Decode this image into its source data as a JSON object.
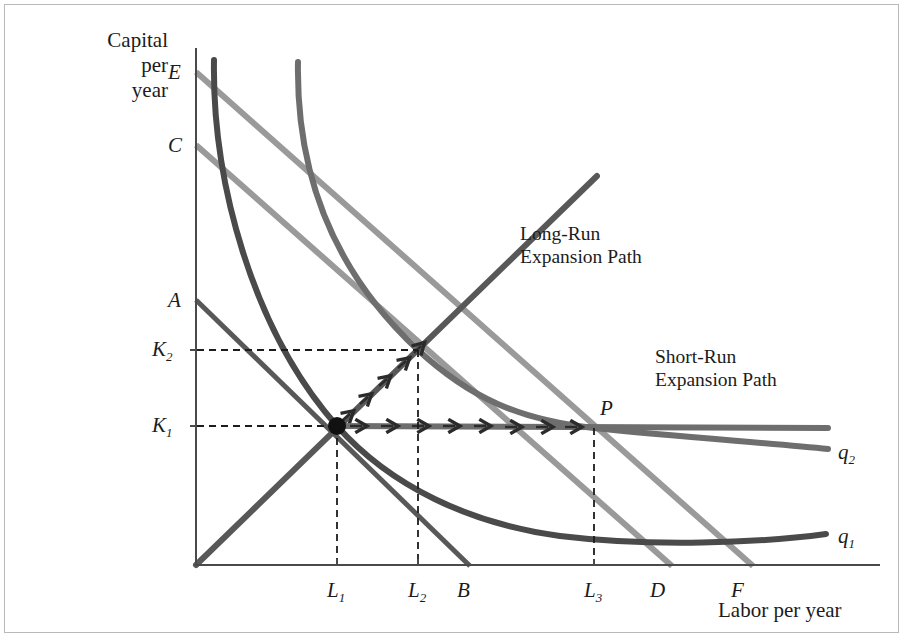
{
  "figure": {
    "type": "economics-isoquant-isocost-diagram",
    "background": "#ffffff",
    "border_color": "#b9b9b9"
  },
  "axes": {
    "y_title_line1": "Capital",
    "y_title_line2": "per",
    "y_title_line3": "year",
    "x_title": "Labor per year",
    "axis_color": "#4a4a4a",
    "origin_px": [
      195,
      565
    ],
    "y_top_px": 48,
    "x_right_px": 880
  },
  "y_ticks": [
    {
      "label": "E",
      "sub": "",
      "y_px": 72
    },
    {
      "label": "C",
      "sub": "",
      "y_px": 145
    },
    {
      "label": "A",
      "sub": "",
      "y_px": 300
    },
    {
      "label": "K",
      "sub": "2",
      "y_px": 350
    },
    {
      "label": "K",
      "sub": "1",
      "y_px": 426
    }
  ],
  "x_ticks": [
    {
      "label": "L",
      "sub": "1",
      "x_px": 337
    },
    {
      "label": "L",
      "sub": "2",
      "x_px": 418
    },
    {
      "label": "B",
      "sub": "",
      "x_px": 463
    },
    {
      "label": "L",
      "sub": "3",
      "x_px": 594
    },
    {
      "label": "D",
      "sub": "",
      "x_px": 656
    },
    {
      "label": "F",
      "sub": "",
      "x_px": 736
    }
  ],
  "isoquants": [
    {
      "name": "q1",
      "label": "q",
      "sub": "1",
      "color": "#4a4a4a",
      "label_pos_px": [
        838,
        536
      ],
      "description": "lower isoquant, from A-B isocost tangency at K1,L1"
    },
    {
      "name": "q2",
      "label": "q",
      "sub": "2",
      "color": "#6e6e6e",
      "label_pos_px": [
        838,
        452
      ],
      "description": "upper isoquant, tangent to E-F isocost at K2,L2 and crossing P"
    }
  ],
  "isocosts": [
    {
      "name": "AB",
      "from": "A",
      "to": "B",
      "color": "#585858",
      "width": 5
    },
    {
      "name": "CD",
      "from": "C",
      "to": "D",
      "color": "#9a9a9a",
      "width": 6
    },
    {
      "name": "EF",
      "from": "E",
      "to": "F",
      "color": "#9a9a9a",
      "width": 6
    }
  ],
  "paths": {
    "long_run": {
      "label_line1": "Long-Run",
      "label_line2": "Expansion Path",
      "label_pos_px": [
        520,
        232
      ],
      "color": "#585858",
      "arrow_color": "#2b2b2b"
    },
    "short_run": {
      "label_line1": "Short-Run",
      "label_line2": "Expansion Path",
      "label_pos_px": [
        660,
        356
      ],
      "color": "#6e6e6e",
      "arrow_color": "#2b2b2b"
    }
  },
  "points": [
    {
      "name": "origin-tangency",
      "label": "",
      "x_px": 337,
      "y_px": 426,
      "marker": "filled-dot"
    },
    {
      "name": "P",
      "label": "P",
      "x_px": 594,
      "y_px": 426,
      "label_pos_px": [
        600,
        400
      ]
    }
  ],
  "guides": {
    "dash_color": "#1c1c1c",
    "dash_pattern": "7 5",
    "lines": [
      {
        "name": "K2-horizontal",
        "from_px": [
          195,
          350
        ],
        "to_px": [
          418,
          350
        ]
      },
      {
        "name": "K1-horizontal",
        "from_px": [
          195,
          426
        ],
        "to_px": [
          337,
          426
        ]
      },
      {
        "name": "L1-vertical",
        "from_px": [
          337,
          426
        ],
        "to_px": [
          337,
          565
        ]
      },
      {
        "name": "L2-vertical",
        "from_px": [
          418,
          350
        ],
        "to_px": [
          418,
          565
        ]
      },
      {
        "name": "L3-vertical",
        "from_px": [
          594,
          426
        ],
        "to_px": [
          594,
          565
        ]
      }
    ]
  }
}
